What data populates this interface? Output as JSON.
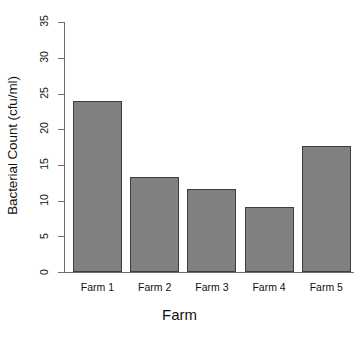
{
  "chart_data": {
    "type": "bar",
    "title": "",
    "xlabel": "Farm",
    "ylabel": "Bacterial Count (cfu/ml)",
    "categories": [
      "Farm 1",
      "Farm 2",
      "Farm 3",
      "Farm 4",
      "Farm 5"
    ],
    "values": [
      23.9,
      13.3,
      11.6,
      9.1,
      17.6
    ],
    "ylim": [
      0,
      35
    ],
    "yticks": [
      0,
      5,
      10,
      15,
      20,
      25,
      30,
      35
    ],
    "ytick_labels": [
      "0",
      "5",
      "10",
      "15",
      "20",
      "25",
      "30",
      "35"
    ],
    "grid": false,
    "legend": false,
    "bar_color": "#808080",
    "bar_border_color": "#3d3d3d",
    "axis_color": "#6e6e6e",
    "background_color": "#ffffff"
  }
}
